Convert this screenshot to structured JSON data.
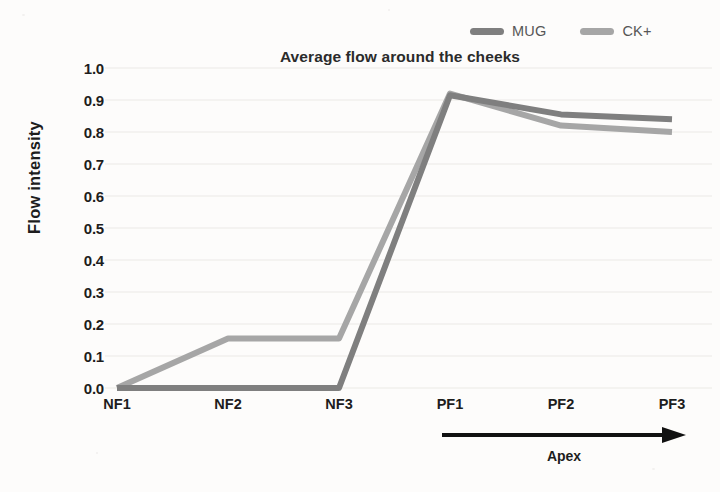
{
  "chart_data": {
    "type": "line",
    "title": "Average flow around the cheeks",
    "xlabel": "",
    "ylabel": "Flow intensity",
    "categories": [
      "NF1",
      "NF2",
      "NF3",
      "PF1",
      "PF2",
      "PF3"
    ],
    "ylim": [
      0.0,
      1.0
    ],
    "ytick_labels": [
      "1.0",
      "0.9",
      "0.8",
      "0.7",
      "0.6",
      "0.5",
      "0.4",
      "0.3",
      "0.2",
      "0.1",
      "0.0"
    ],
    "ytick_values": [
      1.0,
      0.9,
      0.8,
      0.7,
      0.6,
      0.5,
      0.4,
      0.3,
      0.2,
      0.1,
      0.0
    ],
    "grid": true,
    "grid_axis": "y",
    "legend_position": "top-right",
    "series": [
      {
        "name": "MUG",
        "color": "#7f7f7f",
        "values": [
          0.0,
          0.0,
          0.0,
          0.915,
          0.855,
          0.84
        ]
      },
      {
        "name": "CK+",
        "color": "#a6a6a6",
        "values": [
          0.0,
          0.155,
          0.155,
          0.92,
          0.82,
          0.8
        ]
      }
    ],
    "annotations": [
      {
        "name": "apex-arrow",
        "label": "Apex",
        "kind": "arrow-right",
        "from_category": "PF1",
        "to_category": "PF3",
        "color": "#111111"
      }
    ]
  },
  "colors": {
    "background": "#fdfcfb",
    "text": "#1d1d1d",
    "title": "#2b2b2b",
    "legend_text": "#565656",
    "gridline": "#ebe9e6",
    "series_mug": "#7f7f7f",
    "series_ckplus": "#a6a6a6",
    "annotation": "#111111"
  },
  "legend": {
    "entries": [
      {
        "label": "MUG",
        "color": "#7f7f7f"
      },
      {
        "label": "CK+",
        "color": "#a6a6a6"
      }
    ]
  },
  "axes": {
    "y_title": "Flow intensity",
    "x_labels": [
      "NF1",
      "NF2",
      "NF3",
      "PF1",
      "PF2",
      "PF3"
    ],
    "y_labels": [
      "1.0",
      "0.9",
      "0.8",
      "0.7",
      "0.6",
      "0.5",
      "0.4",
      "0.3",
      "0.2",
      "0.1",
      "0.0"
    ]
  },
  "annotation": {
    "apex_label": "Apex"
  }
}
